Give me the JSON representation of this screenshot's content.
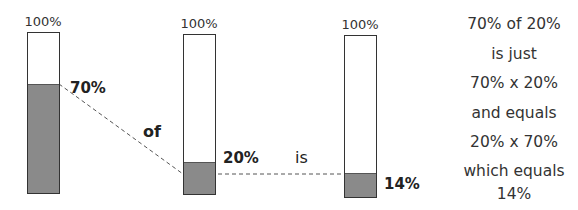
{
  "diagram": {
    "bars": [
      {
        "cap": "100%",
        "label": "70%",
        "fraction": 0.7
      },
      {
        "cap": "100%",
        "label": "20%",
        "fraction": 0.2
      },
      {
        "cap": "100%",
        "label": "14%",
        "fraction": 0.14
      }
    ],
    "connectors": {
      "of": "of",
      "is": "is"
    },
    "explanation": [
      "70% of 20%",
      "is just",
      "70% x 20%",
      "and equals",
      "20% x 70%",
      "which equals",
      "14%"
    ],
    "colors": {
      "fill": "#8a8a8a",
      "outline": "#333333",
      "dash": "#555555"
    }
  }
}
